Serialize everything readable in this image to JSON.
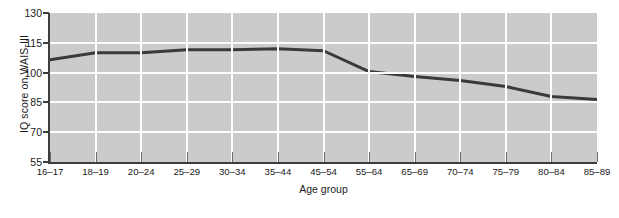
{
  "chart_data": {
    "type": "line",
    "title": "",
    "subtitle": "",
    "xlabel": "Age group",
    "ylabel": "IQ score on WAIS-III",
    "categories": [
      "16–17",
      "18–19",
      "20–24",
      "25–29",
      "30–34",
      "35–44",
      "45–54",
      "55–64",
      "65–69",
      "70–74",
      "75–79",
      "80–84",
      "85–89"
    ],
    "values": [
      106.5,
      110.0,
      110.0,
      111.5,
      111.5,
      112.0,
      111.0,
      100.5,
      98.0,
      96.0,
      93.0,
      88.0,
      86.5
    ],
    "series": [
      {
        "name": "IQ score on WAIS-III",
        "values": [
          106.5,
          110.0,
          110.0,
          111.5,
          111.5,
          112.0,
          111.0,
          100.5,
          98.0,
          96.0,
          93.0,
          88.0,
          86.5
        ]
      }
    ],
    "ylim": [
      55,
      130
    ],
    "yticks": [
      55,
      70,
      85,
      100,
      115,
      130
    ],
    "ytick_labels": [
      "55",
      "70",
      "85",
      "100",
      "115",
      "130"
    ],
    "grid": true,
    "grid_axis": "both",
    "legend": "none",
    "colors": {
      "plot_background": "#cbcbcb",
      "gridline": "#fdfdfd",
      "line": "#3a3a3a",
      "axis": "#3d3d3d",
      "text": "#1a1a1a"
    }
  }
}
